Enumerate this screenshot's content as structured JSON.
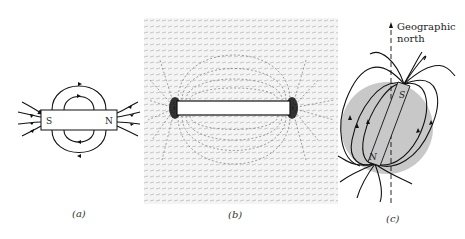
{
  "figure": {
    "panels": [
      {
        "id": "a",
        "caption": "(a)",
        "description": "Bar magnet with field lines",
        "poles": {
          "left": "S",
          "right": "N"
        }
      },
      {
        "id": "b",
        "caption": "(b)",
        "description": "Iron filings pattern around bar magnet"
      },
      {
        "id": "c",
        "caption": "(c)",
        "description": "Earth as a magnet with field lines",
        "poles": {
          "top": "S",
          "bottom": "N"
        },
        "axis_label_line1": "Geographic",
        "axis_label_line2": "north"
      }
    ],
    "colors": {
      "ink": "#111111",
      "earth_fill": "#c8c8c8",
      "background": "#ffffff"
    }
  }
}
